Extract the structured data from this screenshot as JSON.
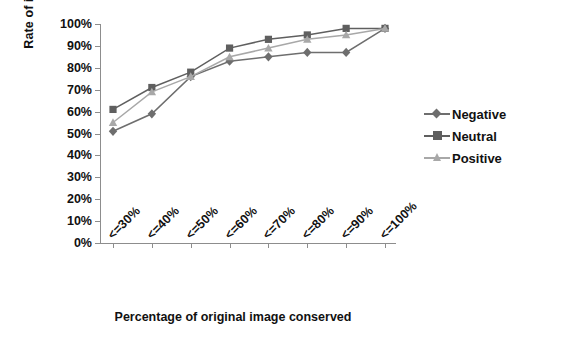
{
  "chart_data": {
    "type": "line",
    "title": "",
    "xlabel": "Percentage of original image conserved",
    "ylabel": "Rate of image",
    "categories": [
      "<=30%",
      "<=40%",
      "<=50%",
      "<=60%",
      "<=70%",
      "<=80%",
      "<=90%",
      "<=100%"
    ],
    "ylim": [
      0,
      100
    ],
    "yticks": [
      "0%",
      "10%",
      "20%",
      "30%",
      "40%",
      "50%",
      "60%",
      "70%",
      "80%",
      "90%",
      "100%"
    ],
    "ytick_values": [
      0,
      10,
      20,
      30,
      40,
      50,
      60,
      70,
      80,
      90,
      100
    ],
    "grid": false,
    "legend_position": "right",
    "series": [
      {
        "name": "Negative",
        "marker": "diamond",
        "color": "#6e6e6e",
        "values": [
          51,
          59,
          76,
          83,
          85,
          87,
          87,
          98
        ]
      },
      {
        "name": "Neutral",
        "marker": "square",
        "color": "#5f5f5f",
        "values": [
          61,
          71,
          78,
          89,
          93,
          95,
          98,
          98
        ]
      },
      {
        "name": "Positive",
        "marker": "triangle",
        "color": "#a8a8a8",
        "values": [
          55,
          69,
          76,
          85,
          89,
          93,
          95,
          98
        ]
      }
    ]
  },
  "legend": {
    "items": [
      {
        "label": "Negative"
      },
      {
        "label": "Neutral"
      },
      {
        "label": "Positive"
      }
    ]
  },
  "colors": {
    "axis": "#8d8d8d",
    "text": "#111111",
    "background": "#ffffff"
  }
}
